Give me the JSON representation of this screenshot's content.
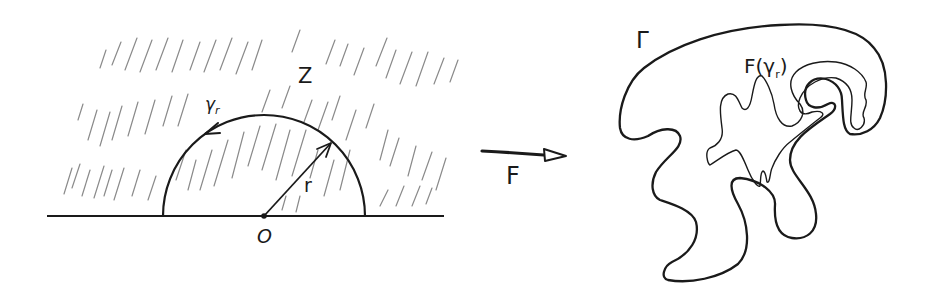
{
  "figure": {
    "left_panel": {
      "region_label": "Z",
      "arc_label": "γ",
      "arc_label_sub": "r",
      "radius_label": "r",
      "origin_label": "O"
    },
    "mapping": {
      "arrow_label": "F"
    },
    "right_panel": {
      "boundary_label": "Γ",
      "image_curve_label": "F(γ",
      "image_curve_label_sub": "r",
      "image_curve_label_close": ")"
    }
  },
  "colors": {
    "ink": "#1a1a1a",
    "hatch": "#8a8a8a",
    "background": "#ffffff"
  }
}
